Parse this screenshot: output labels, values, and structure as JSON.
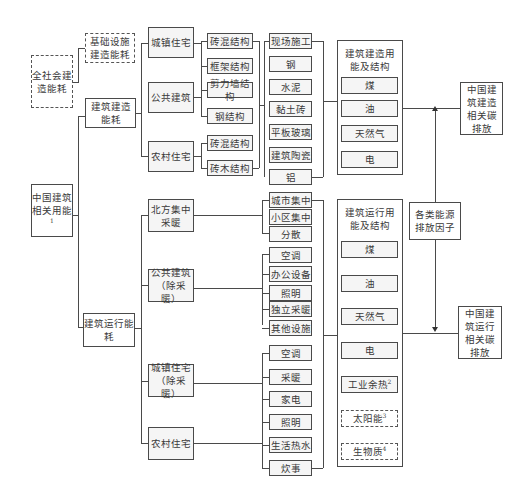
{
  "diagram": {
    "root": {
      "label": "中国建筑相关用能",
      "sup": "1"
    },
    "society": {
      "label": "全社会建造能耗"
    },
    "infra": {
      "label": "基础设施建造能耗"
    },
    "construction": {
      "label": "建筑建造能耗"
    },
    "operation": {
      "label": "建筑运行能耗"
    },
    "construction_types": [
      {
        "label": "城镇住宅"
      },
      {
        "label": "公共建筑"
      },
      {
        "label": "农村住宅"
      }
    ],
    "structures": [
      {
        "label": "砖混结构"
      },
      {
        "label": "框架结构"
      },
      {
        "label": "剪力墙结构"
      },
      {
        "label": "钢结构"
      },
      {
        "label": "砖混结构"
      },
      {
        "label": "砖木结构"
      }
    ],
    "materials": [
      {
        "label": "现场施工"
      },
      {
        "label": "钢"
      },
      {
        "label": "水泥"
      },
      {
        "label": "黏土砖"
      },
      {
        "label": "平板玻璃"
      },
      {
        "label": "建筑陶瓷"
      },
      {
        "label": "铝"
      }
    ],
    "construction_energy": {
      "title": "建筑建造用能及结构",
      "items": [
        {
          "label": "煤"
        },
        {
          "label": "油"
        },
        {
          "label": "天然气"
        },
        {
          "label": "电"
        }
      ]
    },
    "operation_types": [
      {
        "label": "北方集中采暖"
      },
      {
        "label": "公共建筑（除采暖）"
      },
      {
        "label": "城镇住宅（除采暖）"
      },
      {
        "label": "农村住宅"
      }
    ],
    "heating": [
      {
        "label": "城市集中"
      },
      {
        "label": "小区集中"
      },
      {
        "label": "分散"
      }
    ],
    "public_uses": [
      {
        "label": "空调"
      },
      {
        "label": "办公设备"
      },
      {
        "label": "照明"
      },
      {
        "label": "独立采暖"
      },
      {
        "label": "其他设施"
      }
    ],
    "residential_uses": [
      {
        "label": "空调"
      },
      {
        "label": "采暖"
      },
      {
        "label": "家电"
      },
      {
        "label": "照明"
      },
      {
        "label": "生活热水"
      },
      {
        "label": "炊事"
      }
    ],
    "operation_energy": {
      "title": "建筑运行用能及结构",
      "items": [
        {
          "label": "煤",
          "sup": ""
        },
        {
          "label": "油",
          "sup": ""
        },
        {
          "label": "天然气",
          "sup": ""
        },
        {
          "label": "电",
          "sup": ""
        },
        {
          "label": "工业余热",
          "sup": "2"
        },
        {
          "label": "太阳能",
          "sup": "3"
        },
        {
          "label": "生物质",
          "sup": "4"
        }
      ]
    },
    "factors": {
      "label": "各类能源排放因子"
    },
    "construction_emission": {
      "label": "中国建筑建造相关碳排放"
    },
    "operation_emission": {
      "label": "中国建筑运行相关碳排放"
    }
  }
}
